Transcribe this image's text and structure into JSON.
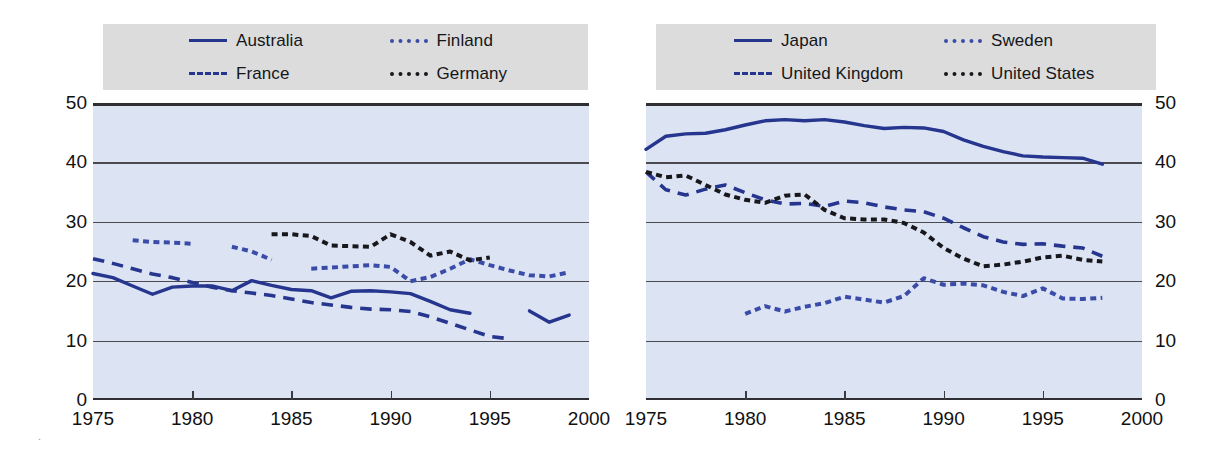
{
  "figure": {
    "background": "#ffffff",
    "plot_background": "#dce4f4",
    "legend_background": "#dcdcdc",
    "accent_blue": "#26368f",
    "accent_black": "#17171c",
    "page_mark": "."
  },
  "axes": {
    "y_ticks": [
      "0",
      "10",
      "20",
      "30",
      "40",
      "50"
    ],
    "y_min": 0,
    "y_max": 50,
    "x_ticks": [
      "1975",
      "1980",
      "1985",
      "1990",
      "1995",
      "2000"
    ],
    "x_min": 1975,
    "x_max": 2000
  },
  "legend_left": {
    "items": [
      {
        "label": "Australia",
        "style": "solid",
        "color": "#26368f"
      },
      {
        "label": "Finland",
        "style": "dotted",
        "color": "#3b4ca8"
      },
      {
        "label": "France",
        "style": "dashed",
        "color": "#26368f"
      },
      {
        "label": "Germany",
        "style": "dotted",
        "color": "#17171c"
      }
    ]
  },
  "legend_right": {
    "items": [
      {
        "label": "Japan",
        "style": "solid",
        "color": "#26368f"
      },
      {
        "label": "Sweden",
        "style": "dotted",
        "color": "#3b4ca8"
      },
      {
        "label": "United Kingdom",
        "style": "dashed",
        "color": "#26368f"
      },
      {
        "label": "United States",
        "style": "dotted",
        "color": "#17171c"
      }
    ]
  },
  "chart_data": [
    {
      "type": "line",
      "title": "",
      "xlabel": "",
      "ylabel": "",
      "xlim": [
        1975,
        2000
      ],
      "ylim": [
        0,
        50
      ],
      "grid": true,
      "legend_position": "top",
      "panel": "left",
      "series": [
        {
          "name": "Australia",
          "style": "solid",
          "color": "#26368f",
          "x": [
            1975,
            1976,
            1977,
            1978,
            1979,
            1980,
            1981,
            1982,
            1983,
            1984,
            1985,
            1986,
            1987,
            1988,
            1989,
            1990,
            1991,
            1992,
            1993,
            1994,
            1997,
            1998,
            1999
          ],
          "y": [
            21.3,
            20.6,
            19.2,
            17.8,
            19.0,
            19.2,
            19.2,
            18.4,
            20.1,
            19.3,
            18.6,
            18.4,
            17.2,
            18.3,
            18.4,
            18.2,
            17.9,
            16.6,
            15.2,
            14.6,
            15.0,
            13.1,
            14.3
          ]
        },
        {
          "name": "France",
          "style": "dashed",
          "color": "#26368f",
          "x": [
            1975,
            1976,
            1977,
            1978,
            1979,
            1980,
            1981,
            1982,
            1983,
            1984,
            1985,
            1986,
            1987,
            1988,
            1989,
            1990,
            1991,
            1992,
            1993,
            1994,
            1995,
            1996
          ],
          "y": [
            23.8,
            23.0,
            22.1,
            21.2,
            20.6,
            19.8,
            19.0,
            18.4,
            18.0,
            17.6,
            17.0,
            16.4,
            16.0,
            15.6,
            15.3,
            15.2,
            14.9,
            14.0,
            12.9,
            11.8,
            10.7,
            10.3
          ]
        },
        {
          "name": "Finland",
          "style": "dotted",
          "color": "#3b4ca8",
          "x": [
            1977,
            1978,
            1979,
            1980,
            1982,
            1983,
            1984,
            1986,
            1987,
            1988,
            1989,
            1990,
            1991,
            1992,
            1993,
            1994,
            1995,
            1996,
            1997,
            1998,
            1999
          ],
          "y": [
            26.9,
            26.6,
            26.5,
            26.3,
            25.8,
            25.0,
            23.6,
            22.1,
            22.3,
            22.5,
            22.7,
            22.4,
            20.0,
            20.7,
            22.1,
            23.7,
            22.7,
            21.8,
            21.0,
            20.8,
            21.5
          ]
        },
        {
          "name": "Germany",
          "style": "dotted",
          "color": "#17171c",
          "x": [
            1984,
            1985,
            1986,
            1987,
            1988,
            1989,
            1990,
            1991,
            1992,
            1993,
            1994,
            1995
          ],
          "y": [
            27.9,
            27.9,
            27.6,
            26.0,
            25.9,
            25.8,
            27.9,
            26.6,
            24.3,
            25.0,
            23.5,
            24.0
          ]
        }
      ]
    },
    {
      "type": "line",
      "title": "",
      "xlabel": "",
      "ylabel": "",
      "xlim": [
        1975,
        2000
      ],
      "ylim": [
        0,
        50
      ],
      "grid": true,
      "legend_position": "top",
      "panel": "right",
      "series": [
        {
          "name": "Japan",
          "style": "solid",
          "color": "#26368f",
          "x": [
            1975,
            1976,
            1977,
            1978,
            1979,
            1980,
            1981,
            1982,
            1983,
            1984,
            1985,
            1986,
            1987,
            1988,
            1989,
            1990,
            1991,
            1992,
            1993,
            1994,
            1995,
            1996,
            1997,
            1998
          ],
          "y": [
            42.2,
            44.4,
            44.8,
            44.9,
            45.5,
            46.3,
            47.0,
            47.2,
            47.0,
            47.2,
            46.8,
            46.2,
            45.7,
            45.9,
            45.8,
            45.2,
            43.8,
            42.7,
            41.8,
            41.1,
            40.9,
            40.8,
            40.7,
            39.7
          ]
        },
        {
          "name": "United Kingdom",
          "style": "dashed",
          "color": "#26368f",
          "x": [
            1975,
            1976,
            1977,
            1978,
            1979,
            1980,
            1981,
            1982,
            1983,
            1984,
            1985,
            1986,
            1987,
            1988,
            1989,
            1990,
            1991,
            1992,
            1993,
            1994,
            1995,
            1996,
            1997,
            1998
          ],
          "y": [
            38.4,
            35.4,
            34.5,
            35.5,
            36.2,
            34.9,
            33.7,
            33.0,
            33.1,
            32.6,
            33.5,
            33.2,
            32.5,
            32.0,
            31.7,
            30.6,
            29.0,
            27.5,
            26.6,
            26.2,
            26.3,
            25.9,
            25.6,
            24.2
          ]
        },
        {
          "name": "Sweden",
          "style": "dotted",
          "color": "#3b4ca8",
          "x": [
            1980,
            1981,
            1982,
            1983,
            1984,
            1985,
            1986,
            1987,
            1988,
            1989,
            1990,
            1991,
            1992,
            1993,
            1994,
            1995,
            1996,
            1997,
            1998
          ],
          "y": [
            14.5,
            15.8,
            14.9,
            15.7,
            16.3,
            17.4,
            16.9,
            16.4,
            17.5,
            20.5,
            19.4,
            19.6,
            19.3,
            18.2,
            17.5,
            18.8,
            17.1,
            17.0,
            17.2
          ]
        },
        {
          "name": "United States",
          "style": "dotted",
          "color": "#17171c",
          "x": [
            1975,
            1976,
            1977,
            1978,
            1979,
            1980,
            1981,
            1982,
            1983,
            1984,
            1985,
            1986,
            1987,
            1988,
            1989,
            1990,
            1991,
            1992,
            1993,
            1994,
            1995,
            1996,
            1997,
            1998
          ],
          "y": [
            38.4,
            37.5,
            37.8,
            36.2,
            34.6,
            33.7,
            33.2,
            34.4,
            34.6,
            32.0,
            30.6,
            30.4,
            30.4,
            29.8,
            28.2,
            25.6,
            23.8,
            22.5,
            22.8,
            23.3,
            24.0,
            24.3,
            23.6,
            23.3
          ]
        }
      ]
    }
  ]
}
